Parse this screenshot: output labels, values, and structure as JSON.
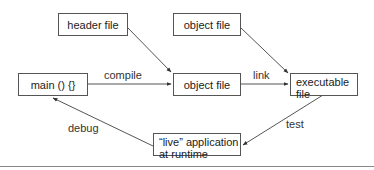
{
  "diagram": {
    "nodes": {
      "header_file": "header file",
      "object_file_top": "object file",
      "main": "main () {}",
      "object_file_mid": "object file",
      "executable_line1": "executable",
      "executable_line2": "file",
      "live_app_line1": "“live” application",
      "live_app_line2": "at runtime"
    },
    "edges": {
      "compile": "compile",
      "link": "link",
      "test": "test",
      "debug": "debug"
    },
    "colors": {
      "stroke": "#555555",
      "text": "#222222",
      "background": "#ffffff"
    }
  }
}
